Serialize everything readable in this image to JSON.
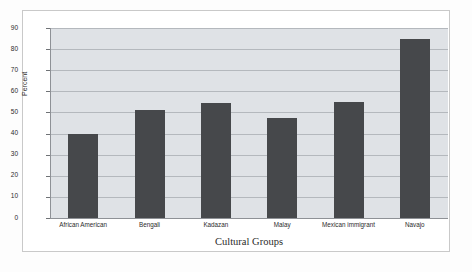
{
  "chart_data": {
    "type": "bar",
    "title": "",
    "subtitle": "",
    "xlabel": "Cultural Groups",
    "ylabel": "Percent",
    "categories": [
      "African American",
      "Bengali",
      "Kadazan",
      "Malay",
      "Mexican immigrant",
      "Navajo"
    ],
    "values": [
      40,
      51,
      54.5,
      47.5,
      55,
      85
    ],
    "series": [
      {
        "name": "Percent",
        "values": [
          40,
          51,
          54.5,
          47.5,
          55,
          85
        ]
      }
    ],
    "ylim": [
      0,
      90
    ],
    "ytick_labels": [
      "0",
      "10",
      "20",
      "30",
      "40",
      "50",
      "60",
      "70",
      "80",
      "90"
    ],
    "ytick_values": [
      0,
      10,
      20,
      30,
      40,
      50,
      60,
      70,
      80,
      90
    ],
    "grid": true,
    "legend": "none",
    "colors": {
      "bar": "#46484b",
      "plot_background": "#dfe2e6",
      "gridline": "#b4b8bd",
      "axis": "#8e9196",
      "text": "#2b2b2b",
      "figure_background": "#ffffff",
      "frame_border": "#c9c9c9"
    }
  }
}
